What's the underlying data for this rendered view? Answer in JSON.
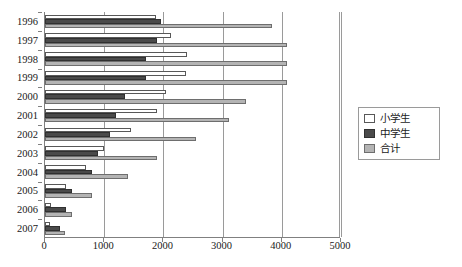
{
  "caption": {
    "top_partial_text": ""
  },
  "legend": {
    "position": "right",
    "items": [
      {
        "label": "小学生",
        "color": "#ffffff",
        "swatch": "white-square-swatch"
      },
      {
        "label": "中学生",
        "color": "#4a4a4a",
        "swatch": "dark-gray-square-swatch"
      },
      {
        "label": "合计",
        "color": "#b4b4b4",
        "swatch": "light-gray-square-swatch"
      }
    ]
  },
  "chart_data": {
    "type": "bar",
    "orientation": "horizontal",
    "title": "",
    "xlabel": "",
    "ylabel": "",
    "xlim": [
      0,
      5000
    ],
    "xticks": [
      0,
      1000,
      2000,
      3000,
      4000,
      5000
    ],
    "xtick_labels": [
      "0",
      "1000",
      "2000",
      "3000",
      "4000",
      "5000"
    ],
    "grid": true,
    "grid_axis": "x",
    "legend_position": "right",
    "categories": [
      "1996",
      "1997",
      "1998",
      "1999",
      "2000",
      "2001",
      "2002",
      "2003",
      "2004",
      "2005",
      "2006",
      "2007"
    ],
    "series": [
      {
        "name": "小学生",
        "color": "#ffffff",
        "values": [
          1880,
          2120,
          2400,
          2390,
          2050,
          1900,
          1450,
          1000,
          700,
          350,
          100,
          80
        ]
      },
      {
        "name": "中学生",
        "color": "#4a4a4a",
        "values": [
          1960,
          1900,
          1700,
          1700,
          1350,
          1200,
          1100,
          900,
          800,
          450,
          350,
          260
        ]
      },
      {
        "name": "合计",
        "color": "#b4b4b4",
        "values": [
          3840,
          4090,
          4090,
          4080,
          3400,
          3100,
          2550,
          1900,
          1400,
          800,
          450,
          330
        ]
      }
    ]
  }
}
